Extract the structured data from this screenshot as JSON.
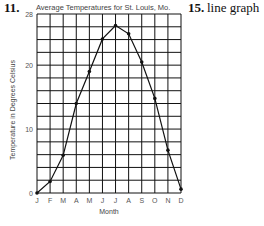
{
  "header": {
    "left_number": "11.",
    "right_number": "15.",
    "right_text": "line graph"
  },
  "chart_data": {
    "type": "line",
    "title": "Average Temperatures for St. Louis, Mo.",
    "xlabel": "Month",
    "ylabel": "Temperature in Degrees Celsius",
    "categories": [
      "J",
      "F",
      "M",
      "A",
      "M",
      "J",
      "J",
      "A",
      "S",
      "O",
      "N",
      "D"
    ],
    "series": [
      {
        "name": "Average Temperature",
        "values": [
          0,
          1.8,
          5.9,
          14.0,
          19.0,
          24.1,
          26.2,
          24.9,
          20.5,
          14.8,
          6.7,
          0.6
        ]
      }
    ],
    "ylim": [
      0,
      28
    ],
    "yticks": [
      0,
      10,
      20,
      28
    ],
    "grid": true,
    "grid_y_step": 2,
    "legend": "none",
    "colors": {
      "line": "#111111",
      "grid": "#111111",
      "text": "#444444"
    }
  }
}
